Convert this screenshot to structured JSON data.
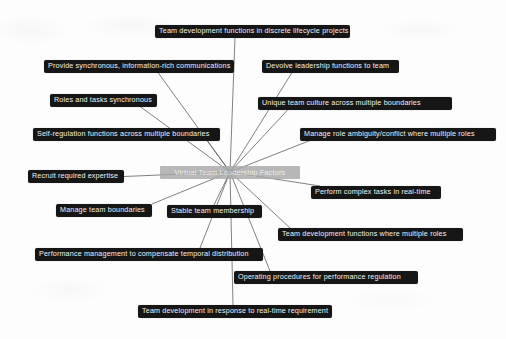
{
  "diagram": {
    "title": "Virtual Team Leadership Factors",
    "type": "radial-mind-map",
    "background_color": "#fdfdfd",
    "node_color": "#161616",
    "node_text_color": "#f2f2f2",
    "center_node_color": "#a8a8a8",
    "edge_color": "#4a4a4a",
    "center": {
      "label": "Virtual Team Leadership Factors",
      "x": 230,
      "y": 172
    },
    "nodes": [
      {
        "id": "team-development-discrete-lifecycle",
        "label": "Team development functions in discrete lifecycle projects",
        "x": 155,
        "y": 25,
        "width": 195,
        "anchor_x": 235,
        "anchor_y": 37.5
      },
      {
        "id": "provide-synchronous-communications",
        "label": "Provide synchronous, information-rich communications",
        "x": 44,
        "y": 60,
        "width": 190,
        "anchor_x": 158,
        "anchor_y": 72.5
      },
      {
        "id": "devolve-leadership-functions",
        "label": "Devolve leadership functions to team",
        "x": 262,
        "y": 60,
        "width": 137,
        "anchor_x": 292,
        "anchor_y": 72.5
      },
      {
        "id": "roles-and-tasks-synchronous",
        "label": "Roles and tasks synchronous",
        "x": 50,
        "y": 94,
        "width": 107,
        "anchor_x": 140,
        "anchor_y": 106.5
      },
      {
        "id": "unique-team-culture",
        "label": "Unique team culture across multiple boundaries",
        "x": 258,
        "y": 97,
        "width": 194,
        "anchor_x": 288,
        "anchor_y": 109.5
      },
      {
        "id": "self-regulation-functions",
        "label": "Self-regulation functions across multiple boundaries",
        "x": 33,
        "y": 128,
        "width": 187,
        "anchor_x": 207,
        "anchor_y": 140.5
      },
      {
        "id": "manage-role-ambiguity",
        "label": "Manage role ambiguity/conflict where multiple roles",
        "x": 300,
        "y": 128,
        "width": 196,
        "anchor_x": 310,
        "anchor_y": 140.5
      },
      {
        "id": "recruit-required-expertise",
        "label": "Recruit required expertise",
        "x": 28,
        "y": 170,
        "width": 96,
        "anchor_x": 124,
        "anchor_y": 176.5
      },
      {
        "id": "perform-complex-tasks",
        "label": "Perform complex tasks in real-time",
        "x": 311,
        "y": 186,
        "width": 130,
        "anchor_x": 320,
        "anchor_y": 186
      },
      {
        "id": "manage-team-boundaries",
        "label": "Manage team boundaries",
        "x": 56,
        "y": 204,
        "width": 96,
        "anchor_x": 152,
        "anchor_y": 204
      },
      {
        "id": "stable-team-membership",
        "label": "Stable team membership",
        "x": 167,
        "y": 205,
        "width": 95,
        "anchor_x": 214,
        "anchor_y": 205
      },
      {
        "id": "team-development-multiple-roles",
        "label": "Team development functions where multiple roles",
        "x": 278,
        "y": 228,
        "width": 185,
        "anchor_x": 290,
        "anchor_y": 228
      },
      {
        "id": "performance-management-temporal",
        "label": "Performance management to compensate temporal distribution",
        "x": 35,
        "y": 248,
        "width": 228,
        "anchor_x": 200,
        "anchor_y": 248
      },
      {
        "id": "operating-procedures",
        "label": "Operating procedures for performance regulation",
        "x": 234,
        "y": 271,
        "width": 184,
        "anchor_x": 270,
        "anchor_y": 271
      },
      {
        "id": "team-development-real-time",
        "label": "Team development in response to real-time requirement",
        "x": 138,
        "y": 305,
        "width": 194,
        "anchor_x": 233,
        "anchor_y": 305
      }
    ]
  }
}
